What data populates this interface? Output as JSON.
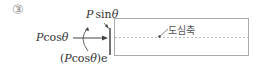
{
  "item_number": "③",
  "labels": {
    "p_sin": {
      "var": "P",
      "func": "sin",
      "angle": "θ"
    },
    "p_cos": {
      "var": "P",
      "func": "cos",
      "angle": "θ"
    },
    "moment": {
      "open": "(",
      "var": "P",
      "func": "cos",
      "angle": "θ",
      "close": ")",
      "suffix": "e"
    },
    "axis": "도심축"
  },
  "colors": {
    "line": "#555555",
    "box": "#aaaaaa",
    "axis": "#bbbbbb"
  }
}
